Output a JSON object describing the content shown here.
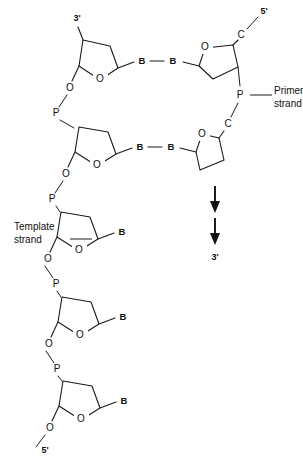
{
  "figure": {
    "ink_color": "#111111",
    "background_color": "#ffffff"
  },
  "labels": {
    "primer_strand_line1": "Primer",
    "primer_strand_line2": "strand",
    "template_strand_line1": "Template",
    "template_strand_line2": "strand",
    "top_left_prime": "3'",
    "top_right_prime": "5'",
    "bottom_left_prime": "5'",
    "arrow_end_prime": "3'"
  },
  "atoms": {
    "oxygen": "O",
    "phosphorus": "P",
    "carbon": "C",
    "base": "B"
  },
  "template_strand": {
    "side": "left",
    "direction_top_to_bottom": "3' to 5'",
    "nucleotides": [
      {
        "index": 1,
        "ring_label": "O",
        "base_label": "B",
        "prime_end": "3'",
        "ring_center_x": 100,
        "ring_center_y": 60
      },
      {
        "index": 2,
        "ring_label": "O",
        "base_label": "B",
        "ring_center_x": 100,
        "ring_center_y": 145
      },
      {
        "index": 3,
        "ring_label": "O",
        "base_label": "B",
        "ring_center_x": 80,
        "ring_center_y": 230
      },
      {
        "index": 4,
        "ring_label": "O",
        "base_label": "B",
        "ring_center_x": 80,
        "ring_center_y": 315
      },
      {
        "index": 5,
        "ring_label": "O",
        "base_label": "B",
        "prime_end": "5'",
        "ring_center_x": 80,
        "ring_center_y": 398
      }
    ],
    "backbone_atoms": [
      "O",
      "P",
      "O"
    ]
  },
  "primer_strand": {
    "side": "right",
    "direction_top_to_bottom": "5' to 3'",
    "nucleotides": [
      {
        "index": 1,
        "ring_label": "O",
        "base_label": "B",
        "prime_end": "5'",
        "carbon_label": "C",
        "ring_center_x": 217,
        "ring_center_y": 62
      },
      {
        "index": 2,
        "ring_label": "O",
        "base_label": "B",
        "carbon_label": "C",
        "ring_center_x": 215,
        "ring_center_y": 150
      }
    ],
    "backbone_atoms": [
      "C",
      "P",
      "C"
    ]
  },
  "base_pairs": [
    {
      "left_base": "B",
      "right_base": "B",
      "y": 62
    },
    {
      "left_base": "B",
      "right_base": "B",
      "y": 148
    }
  ],
  "growth_arrows": {
    "count": 2,
    "direction": "down",
    "terminal_label": "3'",
    "x": 215
  }
}
